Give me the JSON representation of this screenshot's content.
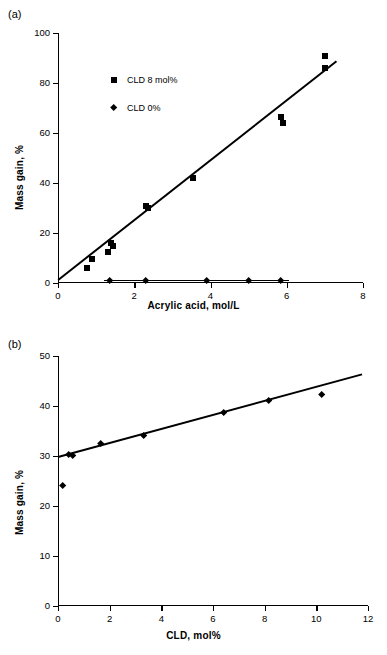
{
  "figure": {
    "panel_a_label": "(a)",
    "panel_b_label": "(b)"
  },
  "chart_data": [
    {
      "type": "scatter",
      "panel": "(a)",
      "title": "",
      "xlabel": "Acrylic acid, mol/L",
      "ylabel": "Mass gain, %",
      "xlim": [
        0,
        8
      ],
      "ylim": [
        0,
        100
      ],
      "xticks": [
        0,
        2,
        4,
        6,
        8
      ],
      "yticks": [
        0,
        20,
        40,
        60,
        80,
        100
      ],
      "grid": false,
      "legend_position": "upper-left-inside",
      "series": [
        {
          "name": "CLD 8 mol%",
          "marker": "square",
          "points": [
            {
              "x": 0.75,
              "y": 6.0
            },
            {
              "x": 0.9,
              "y": 9.5
            },
            {
              "x": 1.3,
              "y": 12.5
            },
            {
              "x": 1.4,
              "y": 16.0
            },
            {
              "x": 1.45,
              "y": 15.0
            },
            {
              "x": 2.3,
              "y": 31.0
            },
            {
              "x": 2.35,
              "y": 30.0
            },
            {
              "x": 3.55,
              "y": 42.0
            },
            {
              "x": 5.85,
              "y": 66.5
            },
            {
              "x": 5.9,
              "y": 64.0
            },
            {
              "x": 7.0,
              "y": 91.0
            },
            {
              "x": 7.0,
              "y": 86.0
            }
          ],
          "fit_line": {
            "x1": 0.0,
            "y1": 1.5,
            "x2": 7.3,
            "y2": 89.0
          }
        },
        {
          "name": "CLD 0%",
          "marker": "diamond",
          "points": [
            {
              "x": 1.35,
              "y": 1.0
            },
            {
              "x": 2.3,
              "y": 1.0
            },
            {
              "x": 3.9,
              "y": 1.0
            },
            {
              "x": 5.0,
              "y": 1.0
            },
            {
              "x": 5.85,
              "y": 1.0
            }
          ],
          "fit_line": {
            "x1": 1.2,
            "y1": 1.0,
            "x2": 6.05,
            "y2": 1.0
          }
        }
      ]
    },
    {
      "type": "scatter",
      "panel": "(b)",
      "title": "",
      "xlabel": "CLD, mol%",
      "ylabel": "Mass gain, %",
      "xlim": [
        0,
        12
      ],
      "ylim": [
        0,
        50
      ],
      "xticks": [
        0,
        2,
        4,
        6,
        8,
        10,
        12
      ],
      "yticks": [
        0,
        10,
        20,
        30,
        40,
        50
      ],
      "grid": false,
      "legend_position": "none",
      "series": [
        {
          "name": "Mass gain vs CLD",
          "marker": "diamond",
          "points": [
            {
              "x": 0.18,
              "y": 24.0
            },
            {
              "x": 0.4,
              "y": 30.2
            },
            {
              "x": 0.55,
              "y": 30.0
            },
            {
              "x": 1.65,
              "y": 32.4
            },
            {
              "x": 3.3,
              "y": 34.0
            },
            {
              "x": 6.4,
              "y": 38.6
            },
            {
              "x": 8.15,
              "y": 41.0
            },
            {
              "x": 10.2,
              "y": 42.3
            }
          ],
          "fit_line": {
            "x1": 0.0,
            "y1": 29.9,
            "x2": 11.75,
            "y2": 46.4
          }
        }
      ]
    }
  ]
}
